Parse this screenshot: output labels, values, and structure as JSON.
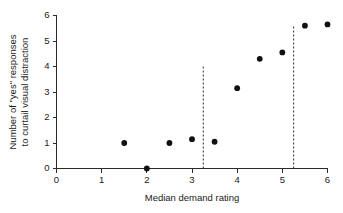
{
  "chart_data": {
    "type": "scatter",
    "title": "",
    "xlabel": "Median demand rating",
    "ylabel": "Number of \"yes\" responses to curtail visual distraction",
    "ylabel_lines": [
      "Number of \"yes\" responses",
      "to curtail visual distraction"
    ],
    "xlim": [
      0,
      6
    ],
    "ylim": [
      0,
      6
    ],
    "xticks": [
      0,
      1,
      2,
      3,
      4,
      5,
      6
    ],
    "yticks": [
      0,
      1,
      2,
      3,
      4,
      5,
      6
    ],
    "xtick_labels": [
      "0",
      "1",
      "2",
      "3",
      "4",
      "5",
      "6"
    ],
    "ytick_labels": [
      "0",
      "1",
      "2",
      "3",
      "4",
      "5",
      "6"
    ],
    "grid": false,
    "legend": false,
    "marker": "filled-circle",
    "marker_color": "#111111",
    "points": [
      {
        "x": 1.5,
        "y": 1.0
      },
      {
        "x": 2.0,
        "y": 0.0
      },
      {
        "x": 2.5,
        "y": 1.0
      },
      {
        "x": 3.0,
        "y": 1.15
      },
      {
        "x": 3.5,
        "y": 1.05
      },
      {
        "x": 4.0,
        "y": 3.15
      },
      {
        "x": 4.5,
        "y": 4.3
      },
      {
        "x": 5.0,
        "y": 4.55
      },
      {
        "x": 5.5,
        "y": 5.6
      },
      {
        "x": 6.0,
        "y": 5.65
      }
    ],
    "annotations": [
      {
        "type": "vertical-dashed-line",
        "x": 3.25,
        "y_from": 0,
        "y_to": 4.05
      },
      {
        "type": "vertical-dashed-line",
        "x": 5.25,
        "y_from": 0,
        "y_to": 5.6
      }
    ]
  },
  "axis_color": "#2b2b2b"
}
